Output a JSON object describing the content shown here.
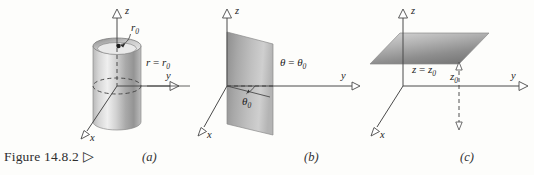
{
  "figure": {
    "caption": "Figure 14.8.2",
    "caption_marker": "▷",
    "background_color": "#fdfdfb",
    "ink_color": "#3a3a3a"
  },
  "panels": [
    {
      "id": "a",
      "label": "(a)",
      "surface_name": "cylinder",
      "axes": [
        {
          "name": "z",
          "label": "z"
        },
        {
          "name": "y",
          "label": "y"
        },
        {
          "name": "x",
          "label": "x"
        }
      ],
      "annotations": [
        {
          "name": "radius-callout",
          "text": "r",
          "sub": "0"
        },
        {
          "name": "surface-equation",
          "lhs": "r",
          "op": " = ",
          "rhs": "r",
          "rhs_sub": "0"
        }
      ]
    },
    {
      "id": "b",
      "label": "(b)",
      "surface_name": "half-plane",
      "axes": [
        {
          "name": "z",
          "label": "z"
        },
        {
          "name": "y",
          "label": "y"
        },
        {
          "name": "x",
          "label": "x"
        }
      ],
      "annotations": [
        {
          "name": "surface-equation",
          "lhs": "θ",
          "op": " = ",
          "rhs": "θ",
          "rhs_sub": "0"
        },
        {
          "name": "angle-callout",
          "text": "θ",
          "sub": "0"
        }
      ]
    },
    {
      "id": "c",
      "label": "(c)",
      "surface_name": "horizontal-plane",
      "axes": [
        {
          "name": "z",
          "label": "z"
        },
        {
          "name": "y",
          "label": "y"
        },
        {
          "name": "x",
          "label": "x"
        }
      ],
      "annotations": [
        {
          "name": "surface-equation",
          "lhs": "z",
          "op": " = ",
          "rhs": "z",
          "rhs_sub": "0"
        },
        {
          "name": "height-callout",
          "text": "z",
          "sub": "0"
        }
      ]
    }
  ]
}
